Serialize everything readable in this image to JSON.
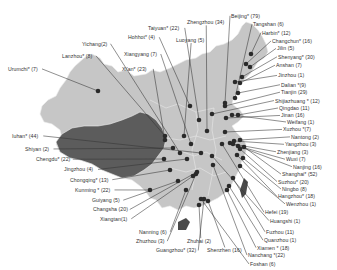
{
  "map": {
    "title": "",
    "colors": {
      "background": "#ffffff",
      "region_light": "#c8c8c8",
      "region_dark": "#5a5a5a",
      "border": "#e8e8e8",
      "leader_line": "#333333",
      "marker": "#2a2a2a",
      "label_text": "#333333"
    },
    "cities": [
      {
        "label": "Urumchi* (7)",
        "lx": 8,
        "ly": 74,
        "px": 98,
        "py": 91
      },
      {
        "label": "Lanzhou* (8)",
        "lx": 62,
        "ly": 60,
        "px": 165,
        "py": 136
      },
      {
        "label": "Yichang(2)",
        "lx": 82,
        "ly": 47,
        "px": 180,
        "py": 153
      },
      {
        "label": "Xi'an* (23)",
        "lx": 122,
        "ly": 74,
        "px": 165,
        "py": 140
      },
      {
        "label": "Xiangyang (7)",
        "lx": 124,
        "ly": 58,
        "px": 191,
        "py": 144
      },
      {
        "label": "Hohhot* (4)",
        "lx": 128,
        "ly": 40,
        "px": 190,
        "py": 106
      },
      {
        "label": "Taiyuan* (22)",
        "lx": 148,
        "ly": 30,
        "px": 199,
        "py": 120
      },
      {
        "label": "Luoyang (5)",
        "lx": 176,
        "ly": 43,
        "px": 184,
        "py": 136
      },
      {
        "label": "Zhengzhou (34)",
        "lx": 187,
        "ly": 24,
        "px": 207,
        "py": 131
      },
      {
        "label": "Beijing* (79)",
        "lx": 231,
        "ly": 17,
        "px": 225,
        "py": 103
      },
      {
        "label": "Tangshan (6)",
        "lx": 253,
        "ly": 26,
        "px": 235,
        "py": 98
      },
      {
        "label": "Harbin* (12)",
        "lx": 262,
        "ly": 35,
        "px": 251,
        "py": 54
      },
      {
        "label": "Changchun* (16)",
        "lx": 272,
        "ly": 44,
        "px": 246,
        "py": 64
      },
      {
        "label": "Jilin (5)",
        "lx": 277,
        "ly": 52,
        "px": 250,
        "py": 67
      },
      {
        "label": "Shenyang* (30)",
        "lx": 278,
        "ly": 61,
        "px": 242,
        "py": 77
      },
      {
        "label": "Anshan (7)",
        "lx": 276,
        "ly": 70,
        "px": 240,
        "py": 83
      },
      {
        "label": "Jinzhou (1)",
        "lx": 278,
        "ly": 81,
        "px": 235,
        "py": 82
      },
      {
        "label": "Dalian *(9)",
        "lx": 281,
        "ly": 91,
        "px": 238,
        "py": 93
      },
      {
        "label": "Tianjin (29)",
        "lx": 281,
        "ly": 99,
        "px": 225,
        "py": 106
      },
      {
        "label": "Shijiazhuang * (12)",
        "lx": 275,
        "ly": 108,
        "px": 212,
        "py": 114
      },
      {
        "label": "Qingdao (11)",
        "lx": 279,
        "ly": 116,
        "px": 238,
        "py": 115
      },
      {
        "label": "Jinan (16)",
        "lx": 281,
        "ly": 124,
        "px": 226,
        "py": 118
      },
      {
        "label": "Weifang (1)",
        "lx": 287,
        "ly": 131,
        "px": 232,
        "py": 115
      },
      {
        "label": "Xuzhou *(7)",
        "lx": 283,
        "ly": 139,
        "px": 225,
        "py": 132
      },
      {
        "label": "Nantong (2)",
        "lx": 291,
        "ly": 147,
        "px": 240,
        "py": 140
      },
      {
        "label": "Yangzhou (3)",
        "lx": 285,
        "ly": 155,
        "px": 234,
        "py": 141
      },
      {
        "label": "Zhenjiang (3)",
        "lx": 277,
        "ly": 163,
        "px": 233,
        "py": 144
      },
      {
        "label": "Wuxi (7)",
        "lx": 286,
        "ly": 171,
        "px": 238,
        "py": 146
      },
      {
        "label": "Nanjing (16)",
        "lx": 293,
        "ly": 179,
        "px": 230,
        "py": 143
      },
      {
        "label": "Shanghai* (52)",
        "lx": 282,
        "ly": 187,
        "px": 244,
        "py": 147
      },
      {
        "label": "Suzhou* (20)",
        "lx": 278,
        "ly": 195,
        "px": 240,
        "py": 149
      },
      {
        "label": "Ningbo (8)",
        "lx": 282,
        "ly": 203,
        "px": 243,
        "py": 158
      },
      {
        "label": "Hangzhou* (18)",
        "lx": 278,
        "ly": 211,
        "px": 237,
        "py": 155
      },
      {
        "label": "Wenzhou (1)",
        "lx": 286,
        "ly": 219,
        "px": 240,
        "py": 166
      },
      {
        "label": "Hefei (19)",
        "lx": 265,
        "ly": 228,
        "px": 222,
        "py": 144
      },
      {
        "label": "Huangshi (1)",
        "lx": 270,
        "ly": 237,
        "px": 212,
        "py": 156
      },
      {
        "label": "Fuzhou (11)",
        "lx": 266,
        "ly": 249,
        "px": 233,
        "py": 178
      },
      {
        "label": "Quanzhou (1)",
        "lx": 264,
        "ly": 258,
        "px": 229,
        "py": 186
      },
      {
        "label": "Xiamen * (18)",
        "lx": 257,
        "ly": 266,
        "px": 227,
        "py": 190
      },
      {
        "label": "Nanchang *(22)",
        "lx": 248,
        "ly": 274,
        "px": 213,
        "py": 165
      },
      {
        "label": "Foshan (6)",
        "lx": 250,
        "ly": 287,
        "px": 201,
        "py": 199
      },
      {
        "label": "Shenzhen (16)",
        "lx": 207,
        "ly": 269,
        "px": 208,
        "py": 201
      },
      {
        "label": "Zhuhai (2)",
        "lx": 187,
        "ly": 259,
        "px": 199,
        "py": 205
      },
      {
        "label": "Guangzhou* (32)",
        "lx": 156,
        "ly": 269,
        "px": 204,
        "py": 199
      },
      {
        "label": "Zhuzhou (3)",
        "lx": 136,
        "ly": 259,
        "px": 196,
        "py": 174
      },
      {
        "label": "Nanning (6)",
        "lx": 139,
        "ly": 249,
        "px": 186,
        "py": 190
      },
      {
        "label": "Xiangtan(1)",
        "lx": 100,
        "ly": 235,
        "px": 193,
        "py": 176
      },
      {
        "label": "Changsha (20)",
        "lx": 93,
        "ly": 225,
        "px": 197,
        "py": 172
      },
      {
        "label": "Guiyang (5)",
        "lx": 92,
        "ly": 215,
        "px": 178,
        "py": 181
      },
      {
        "label": "Kunming * (22)",
        "lx": 75,
        "ly": 204,
        "px": 150,
        "py": 190
      },
      {
        "label": "Chongqing* (13)",
        "lx": 70,
        "ly": 193,
        "px": 170,
        "py": 170
      },
      {
        "label": "Jingzhou (4)",
        "lx": 64,
        "ly": 182,
        "px": 187,
        "py": 159
      },
      {
        "label": "Chengdu* (22)",
        "lx": 36,
        "ly": 171,
        "px": 164,
        "py": 159
      },
      {
        "label": "Shiyan (2)",
        "lx": 25,
        "ly": 160,
        "px": 173,
        "py": 148
      },
      {
        "label": "Iuhan* (44)",
        "lx": 12,
        "ly": 146,
        "px": 201,
        "py": 153
      }
    ]
  }
}
